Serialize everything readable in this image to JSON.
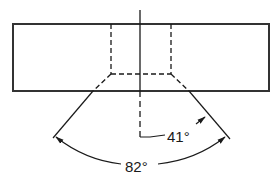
{
  "diagram": {
    "type": "technical-drawing",
    "colors": {
      "line": "#1a1a1a",
      "background": "#ffffff"
    },
    "labels": {
      "half_angle": "41°",
      "included_angle": "82°"
    },
    "dimensions": {
      "half_angle_deg": 41,
      "included_angle_deg": 82
    }
  }
}
